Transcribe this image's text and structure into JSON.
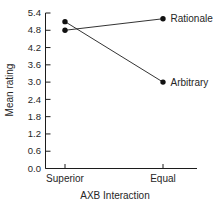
{
  "chart_data": {
    "type": "line",
    "title": "",
    "xlabel": "AXB Interaction",
    "ylabel": "Mean rating",
    "categories": [
      "Superior",
      "Equal"
    ],
    "series": [
      {
        "name": "Rationale",
        "values": [
          4.8,
          5.2
        ]
      },
      {
        "name": "Arbitrary",
        "values": [
          5.1,
          3.0
        ]
      }
    ],
    "yticks": [
      0.0,
      0.6,
      1.2,
      1.8,
      2.4,
      3.0,
      3.6,
      4.2,
      4.8,
      5.4
    ],
    "ylim": [
      0,
      5.4
    ],
    "grid": false,
    "legend_position": "right-of-last-point",
    "marker": "filled-circle",
    "tick_direction": "inward",
    "colors": {
      "line": "#1c1c1c",
      "marker": "#111111",
      "text": "#262626",
      "background": "#ffffff"
    }
  }
}
